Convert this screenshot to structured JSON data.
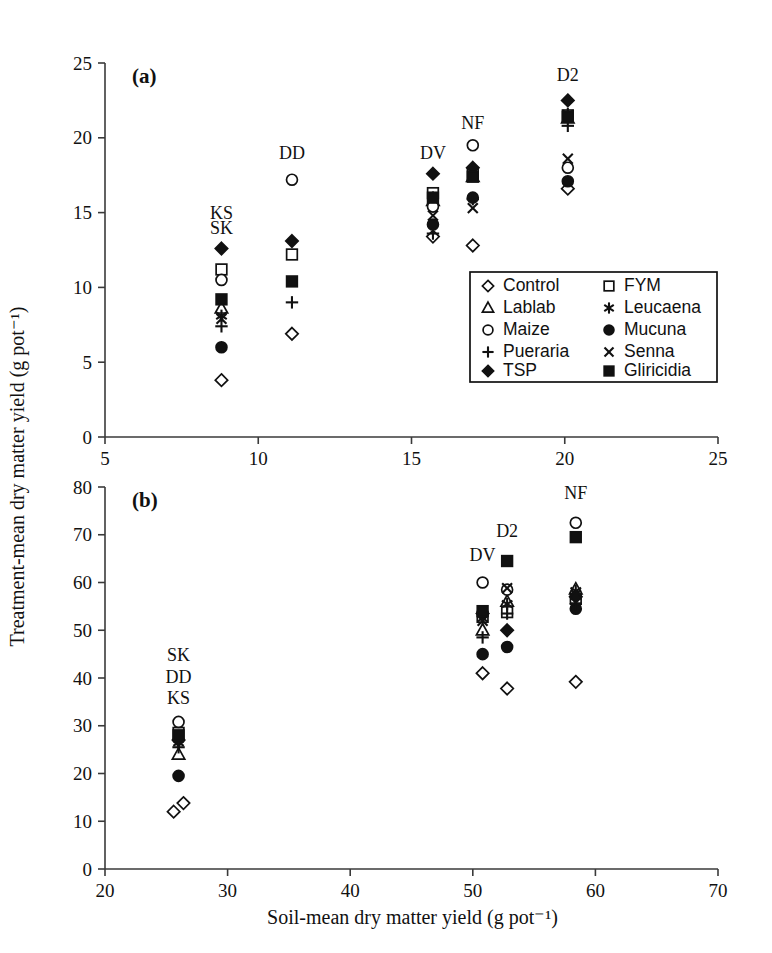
{
  "figure": {
    "axis_label_x": "Soil-mean dry matter yield (g pot⁻¹)",
    "axis_label_y": "Treatment-mean dry matter yield (g pot⁻¹)",
    "panel_a_label": "(a)",
    "panel_b_label": "(b)",
    "ink_color": "#111111",
    "background_color": "#ffffff"
  },
  "legend": {
    "position": "inside-panel-a-lower-right",
    "columns": 2,
    "entries": [
      {
        "label": "Control",
        "marker": "open-diamond"
      },
      {
        "label": "FYM",
        "marker": "open-square"
      },
      {
        "label": "Lablab",
        "marker": "open-triangle"
      },
      {
        "label": "Leucaena",
        "marker": "asterisk"
      },
      {
        "label": "Maize",
        "marker": "open-circle"
      },
      {
        "label": "Mucuna",
        "marker": "filled-circle"
      },
      {
        "label": "Pueraria",
        "marker": "plus"
      },
      {
        "label": "Senna",
        "marker": "cross"
      },
      {
        "label": "TSP",
        "marker": "filled-diamond"
      },
      {
        "label": "Gliricidia",
        "marker": "filled-square"
      }
    ]
  },
  "chart_data": [
    {
      "type": "scatter",
      "panel": "(a)",
      "title": "",
      "xlabel": "Soil-mean dry matter yield (g pot⁻¹)",
      "ylabel": "Treatment-mean dry matter yield (g pot⁻¹)",
      "xlim": [
        5,
        25
      ],
      "ylim": [
        0,
        25
      ],
      "xticks": [
        5,
        10,
        15,
        20,
        25
      ],
      "yticks": [
        0,
        5,
        10,
        15,
        20,
        25
      ],
      "grid": false,
      "annotations": [
        {
          "text": "KS",
          "x": 8.8,
          "y": 14.6
        },
        {
          "text": "SK",
          "x": 8.8,
          "y": 13.6
        },
        {
          "text": "DD",
          "x": 11.1,
          "y": 18.6
        },
        {
          "text": "DV",
          "x": 15.7,
          "y": 18.6
        },
        {
          "text": "NF",
          "x": 17.0,
          "y": 20.6
        },
        {
          "text": "D2",
          "x": 20.1,
          "y": 23.8
        }
      ],
      "series": [
        {
          "name": "Control",
          "marker": "open-diamond",
          "points": [
            {
              "x": 8.8,
              "y": 3.8
            },
            {
              "x": 11.1,
              "y": 6.9
            },
            {
              "x": 15.7,
              "y": 13.4
            },
            {
              "x": 17.0,
              "y": 12.8
            },
            {
              "x": 20.1,
              "y": 16.6
            }
          ]
        },
        {
          "name": "FYM",
          "marker": "open-square",
          "points": [
            {
              "x": 8.8,
              "y": 11.2
            },
            {
              "x": 11.1,
              "y": 12.2
            },
            {
              "x": 15.7,
              "y": 16.3
            },
            {
              "x": 17.0,
              "y": 17.6
            },
            {
              "x": 20.1,
              "y": 21.5
            }
          ]
        },
        {
          "name": "Lablab",
          "marker": "open-triangle",
          "points": [
            {
              "x": 8.8,
              "y": 8.6
            },
            {
              "x": 15.7,
              "y": 15.8
            },
            {
              "x": 17.0,
              "y": 17.4
            },
            {
              "x": 20.1,
              "y": 21.3
            }
          ]
        },
        {
          "name": "Leucaena",
          "marker": "asterisk",
          "points": [
            {
              "x": 8.8,
              "y": 8.1
            },
            {
              "x": 15.7,
              "y": 16.0
            },
            {
              "x": 17.0,
              "y": 17.5
            },
            {
              "x": 20.1,
              "y": 21.6
            }
          ]
        },
        {
          "name": "Maize",
          "marker": "open-circle",
          "points": [
            {
              "x": 8.8,
              "y": 10.5
            },
            {
              "x": 11.1,
              "y": 17.2
            },
            {
              "x": 15.7,
              "y": 15.4
            },
            {
              "x": 17.0,
              "y": 19.5
            },
            {
              "x": 20.1,
              "y": 18.0
            }
          ]
        },
        {
          "name": "Mucuna",
          "marker": "filled-circle",
          "points": [
            {
              "x": 8.8,
              "y": 6.0
            },
            {
              "x": 15.7,
              "y": 14.2
            },
            {
              "x": 17.0,
              "y": 16.0
            },
            {
              "x": 20.1,
              "y": 17.1
            }
          ]
        },
        {
          "name": "Pueraria",
          "marker": "plus",
          "points": [
            {
              "x": 8.8,
              "y": 7.4
            },
            {
              "x": 11.1,
              "y": 9.0
            },
            {
              "x": 15.7,
              "y": 13.6
            },
            {
              "x": 17.0,
              "y": 15.9
            },
            {
              "x": 20.1,
              "y": 20.8
            }
          ]
        },
        {
          "name": "Senna",
          "marker": "cross",
          "points": [
            {
              "x": 8.8,
              "y": 7.9
            },
            {
              "x": 15.7,
              "y": 14.8
            },
            {
              "x": 17.0,
              "y": 15.3
            },
            {
              "x": 20.1,
              "y": 18.6
            }
          ]
        },
        {
          "name": "TSP",
          "marker": "filled-diamond",
          "points": [
            {
              "x": 8.8,
              "y": 12.6
            },
            {
              "x": 11.1,
              "y": 13.1
            },
            {
              "x": 15.7,
              "y": 17.6
            },
            {
              "x": 17.0,
              "y": 18.0
            },
            {
              "x": 20.1,
              "y": 22.5
            }
          ]
        },
        {
          "name": "Gliricidia",
          "marker": "filled-square",
          "points": [
            {
              "x": 8.8,
              "y": 9.2
            },
            {
              "x": 11.1,
              "y": 10.4
            },
            {
              "x": 15.7,
              "y": 16.0
            },
            {
              "x": 17.0,
              "y": 17.4
            },
            {
              "x": 20.1,
              "y": 21.4
            }
          ]
        }
      ]
    },
    {
      "type": "scatter",
      "panel": "(b)",
      "title": "",
      "xlabel": "Soil-mean dry matter yield (g pot⁻¹)",
      "ylabel": "Treatment-mean dry matter yield (g pot⁻¹)",
      "xlim": [
        20,
        70
      ],
      "ylim": [
        0,
        80
      ],
      "xticks": [
        20,
        30,
        40,
        50,
        60,
        70
      ],
      "yticks": [
        0,
        10,
        20,
        30,
        40,
        50,
        60,
        70,
        80
      ],
      "grid": false,
      "annotations": [
        {
          "text": "SK",
          "x": 26.0,
          "y": 43.5
        },
        {
          "text": "DD",
          "x": 26.0,
          "y": 39.0
        },
        {
          "text": "KS",
          "x": 26.0,
          "y": 34.5
        },
        {
          "text": "DV",
          "x": 50.8,
          "y": 64.5
        },
        {
          "text": "D2",
          "x": 52.8,
          "y": 69.5
        },
        {
          "text": "NF",
          "x": 58.4,
          "y": 77.5
        }
      ],
      "series": [
        {
          "name": "Control",
          "marker": "open-diamond",
          "points": [
            {
              "x": 25.6,
              "y": 12.0
            },
            {
              "x": 26.4,
              "y": 13.8
            },
            {
              "x": 50.8,
              "y": 41.0
            },
            {
              "x": 52.8,
              "y": 37.8
            },
            {
              "x": 58.4,
              "y": 39.2
            }
          ]
        },
        {
          "name": "FYM",
          "marker": "open-square",
          "points": [
            {
              "x": 26.0,
              "y": 28.5
            },
            {
              "x": 50.8,
              "y": 52.8
            },
            {
              "x": 52.8,
              "y": 53.8
            },
            {
              "x": 58.4,
              "y": 56.8
            }
          ]
        },
        {
          "name": "Lablab",
          "marker": "open-triangle",
          "points": [
            {
              "x": 26.0,
              "y": 24.0
            },
            {
              "x": 50.8,
              "y": 50.0
            },
            {
              "x": 52.8,
              "y": 56.0
            },
            {
              "x": 58.4,
              "y": 58.6
            }
          ]
        },
        {
          "name": "Leucaena",
          "marker": "asterisk",
          "points": [
            {
              "x": 26.0,
              "y": 26.5
            },
            {
              "x": 50.8,
              "y": 52.5
            },
            {
              "x": 52.8,
              "y": 55.5
            },
            {
              "x": 58.4,
              "y": 58.2
            }
          ]
        },
        {
          "name": "Maize",
          "marker": "open-circle",
          "points": [
            {
              "x": 26.0,
              "y": 30.8
            },
            {
              "x": 50.8,
              "y": 60.0
            },
            {
              "x": 52.8,
              "y": 58.5
            },
            {
              "x": 58.4,
              "y": 72.5
            }
          ]
        },
        {
          "name": "Mucuna",
          "marker": "filled-circle",
          "points": [
            {
              "x": 26.0,
              "y": 19.5
            },
            {
              "x": 50.8,
              "y": 45.0
            },
            {
              "x": 52.8,
              "y": 46.5
            },
            {
              "x": 58.4,
              "y": 54.5
            }
          ]
        },
        {
          "name": "Pueraria",
          "marker": "plus",
          "points": [
            {
              "x": 26.0,
              "y": 25.5
            },
            {
              "x": 50.8,
              "y": 48.5
            },
            {
              "x": 52.8,
              "y": 53.5
            },
            {
              "x": 58.4,
              "y": 55.5
            }
          ]
        },
        {
          "name": "Senna",
          "marker": "cross",
          "points": [
            {
              "x": 26.0,
              "y": 27.5
            },
            {
              "x": 50.8,
              "y": 52.0
            },
            {
              "x": 52.8,
              "y": 58.8
            },
            {
              "x": 58.4,
              "y": 57.5
            }
          ]
        },
        {
          "name": "TSP",
          "marker": "filled-diamond",
          "points": [
            {
              "x": 26.0,
              "y": 27.0
            },
            {
              "x": 50.8,
              "y": 53.5
            },
            {
              "x": 52.8,
              "y": 50.0
            },
            {
              "x": 58.4,
              "y": 57.0
            }
          ]
        },
        {
          "name": "Gliricidia",
          "marker": "filled-square",
          "points": [
            {
              "x": 26.0,
              "y": 28.0
            },
            {
              "x": 50.8,
              "y": 54.0
            },
            {
              "x": 52.8,
              "y": 64.5
            },
            {
              "x": 58.4,
              "y": 69.5
            }
          ]
        }
      ]
    }
  ]
}
